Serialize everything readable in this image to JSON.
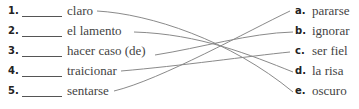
{
  "left_items": [
    {
      "number": "1.",
      "term": "claro"
    },
    {
      "number": "2.",
      "term": "el lamento"
    },
    {
      "number": "3.",
      "term": "hacer caso (de)"
    },
    {
      "number": "4.",
      "term": "traicionar"
    },
    {
      "number": "5.",
      "term": "sentarse"
    }
  ],
  "right_items": [
    {
      "letter": "a.",
      "term": "pararse"
    },
    {
      "letter": "b.",
      "term": "ignorar"
    },
    {
      "letter": "c.",
      "term": "ser fiel"
    },
    {
      "letter": "d.",
      "term": "la risa"
    },
    {
      "letter": "e.",
      "term": "oscuro"
    }
  ],
  "matches": [
    {
      "from": "1",
      "to": "e"
    },
    {
      "from": "2",
      "to": "d"
    },
    {
      "from": "3",
      "to": "b"
    },
    {
      "from": "4",
      "to": "c"
    },
    {
      "from": "5",
      "to": "a"
    }
  ],
  "line_color": "#888888"
}
